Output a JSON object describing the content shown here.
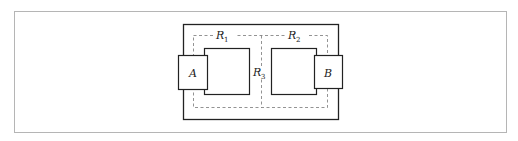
{
  "diagram": {
    "frame": {
      "stroke": "#b0b0b0"
    },
    "outer_rect": {
      "stroke": "#222222"
    },
    "dashed_regions": {
      "stroke": "#777777"
    },
    "labels": {
      "A": "A",
      "B": "B",
      "R1": {
        "main": "R",
        "sub": "1"
      },
      "R2": {
        "main": "R",
        "sub": "2"
      },
      "R3": {
        "main": "R",
        "sub": "3"
      }
    }
  }
}
